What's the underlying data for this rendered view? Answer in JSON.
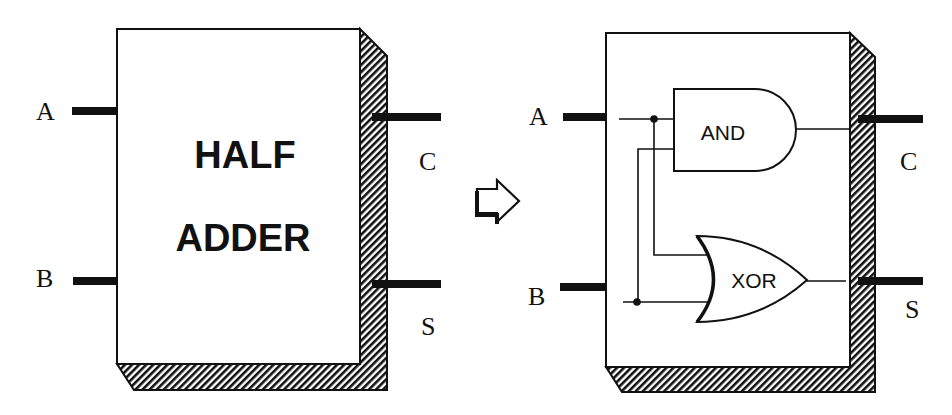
{
  "diagram": {
    "kind": "logic-circuit",
    "colors": {
      "ink": "#111111",
      "background": "#ffffff"
    },
    "left_block": {
      "title_line1": "HALF",
      "title_line2": "ADDER",
      "inputs": [
        "A",
        "B"
      ],
      "outputs": [
        "C",
        "S"
      ]
    },
    "transform_arrow": "right-arrow-icon",
    "right_block": {
      "inputs": [
        "A",
        "B"
      ],
      "outputs": [
        "C",
        "S"
      ],
      "gates": [
        {
          "label": "AND",
          "type": "and-gate",
          "output": "C"
        },
        {
          "label": "XOR",
          "type": "xor-gate",
          "output": "S"
        }
      ]
    }
  }
}
